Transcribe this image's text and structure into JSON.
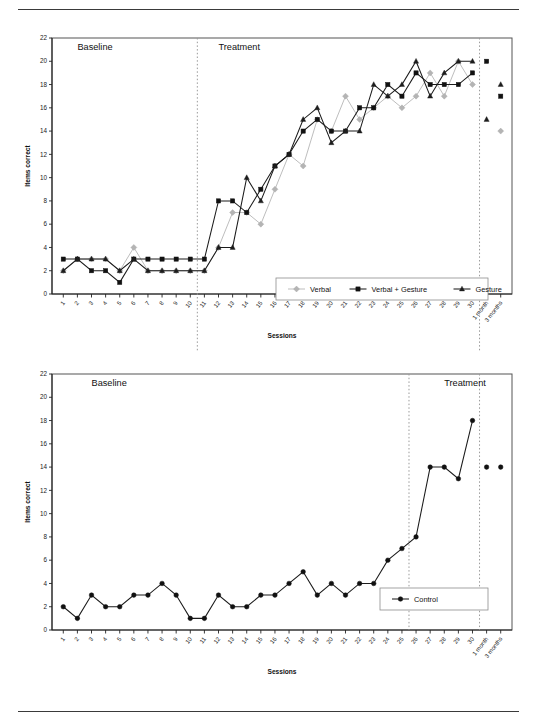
{
  "figure": {
    "panels": [
      {
        "id": "experimental-panel",
        "phase_labels": {
          "baseline": "Baseline",
          "treatment": "Treatment"
        },
        "phase_break_after_session": 10,
        "followup_break_after_session": 30
      },
      {
        "id": "control-panel",
        "phase_labels": {
          "baseline": "Baseline",
          "treatment": "Treatment"
        },
        "phase_break_after_session": 25,
        "followup_break_after_session": 30
      }
    ]
  },
  "chart_data": [
    {
      "type": "line",
      "id": "experimental-participant-chart",
      "title": "",
      "xlabel": "Sessions",
      "ylabel": "Items correct",
      "ylim": [
        0,
        22
      ],
      "ytick_step": 2,
      "yticks": [
        0,
        2,
        4,
        6,
        8,
        10,
        12,
        14,
        16,
        18,
        20,
        22
      ],
      "grid": false,
      "legend_position": "inside-bottom-right",
      "annotations": [
        {
          "text": "Baseline",
          "x_session": 2,
          "y": 21
        },
        {
          "text": "Treatment",
          "x_session": 12,
          "y": 21
        }
      ],
      "phase_dividers": [
        "after-session-10",
        "after-session-30"
      ],
      "categories": [
        "1",
        "2",
        "3",
        "4",
        "5",
        "6",
        "7",
        "8",
        "9",
        "10",
        "11",
        "12",
        "13",
        "14",
        "15",
        "16",
        "17",
        "18",
        "19",
        "20",
        "21",
        "22",
        "23",
        "24",
        "25",
        "26",
        "27",
        "28",
        "29",
        "30",
        "1 month",
        "3 months"
      ],
      "series": [
        {
          "name": "Verbal",
          "marker": "diamond",
          "color": "#b4b4b4",
          "values": [
            2,
            3,
            3,
            3,
            2,
            4,
            2,
            2,
            2,
            2,
            2,
            4,
            7,
            7,
            6,
            9,
            12,
            11,
            15,
            14,
            17,
            15,
            16,
            17,
            16,
            17,
            19,
            17,
            20,
            18,
            null,
            14
          ]
        },
        {
          "name": "Verbal + Gesture",
          "marker": "square",
          "color": "#111111",
          "values": [
            3,
            3,
            2,
            2,
            1,
            3,
            3,
            3,
            3,
            3,
            3,
            8,
            8,
            7,
            9,
            11,
            12,
            14,
            15,
            14,
            14,
            16,
            16,
            18,
            17,
            19,
            18,
            18,
            18,
            19,
            20,
            17
          ]
        },
        {
          "name": "Gesture",
          "marker": "triangle",
          "color": "#1d1d1d",
          "values": [
            2,
            3,
            3,
            3,
            2,
            3,
            2,
            2,
            2,
            2,
            2,
            4,
            4,
            10,
            8,
            11,
            12,
            15,
            16,
            13,
            14,
            14,
            18,
            17,
            18,
            20,
            17,
            19,
            20,
            20,
            15,
            18
          ]
        }
      ]
    },
    {
      "type": "line",
      "id": "control-participant-chart",
      "title": "",
      "xlabel": "Sessions",
      "ylabel": "Items correct",
      "ylim": [
        0,
        22
      ],
      "ytick_step": 2,
      "yticks": [
        0,
        2,
        4,
        6,
        8,
        10,
        12,
        14,
        16,
        18,
        20,
        22
      ],
      "grid": false,
      "legend_position": "inside-bottom-right",
      "annotations": [
        {
          "text": "Baseline",
          "x_session": 3,
          "y": 21
        },
        {
          "text": "Treatment",
          "x_session": 28,
          "y": 21
        }
      ],
      "phase_dividers": [
        "after-session-25",
        "after-session-30"
      ],
      "categories": [
        "1",
        "2",
        "3",
        "4",
        "5",
        "6",
        "7",
        "8",
        "9",
        "10",
        "11",
        "12",
        "13",
        "14",
        "15",
        "16",
        "17",
        "18",
        "19",
        "20",
        "21",
        "22",
        "23",
        "24",
        "25",
        "26",
        "27",
        "28",
        "29",
        "30",
        "1 month",
        "3 months"
      ],
      "series": [
        {
          "name": "Control",
          "marker": "circle",
          "color": "#111111",
          "values": [
            2,
            1,
            3,
            2,
            2,
            3,
            3,
            4,
            3,
            1,
            1,
            3,
            2,
            2,
            3,
            3,
            4,
            5,
            3,
            4,
            3,
            4,
            4,
            6,
            7,
            8,
            14,
            14,
            13,
            18,
            14,
            14
          ]
        }
      ]
    }
  ]
}
